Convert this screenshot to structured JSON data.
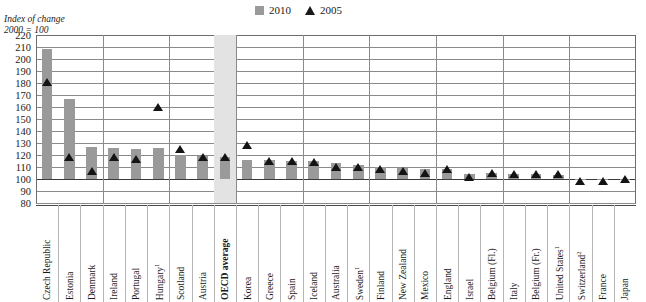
{
  "axis_title": {
    "line1": "Index of change",
    "line2": "2000 = 100"
  },
  "legend": {
    "items": [
      {
        "label": "2010",
        "marker": "square-marker",
        "color": "#9a9a9a"
      },
      {
        "label": "2005",
        "marker": "triangle-marker",
        "color": "#141414"
      }
    ]
  },
  "chart_data": {
    "type": "bar",
    "title": "Index of change",
    "subtitle": "2000 = 100",
    "xlabel": "",
    "ylabel": "Index of change (2000 = 100)",
    "ylim": [
      80,
      220
    ],
    "ytick_step": 10,
    "yticks": [
      220,
      210,
      200,
      190,
      180,
      170,
      160,
      150,
      140,
      130,
      120,
      110,
      100,
      90,
      80
    ],
    "grid": true,
    "legend_position": "top-center",
    "reference_line": 100,
    "highlight_category": "OECD average",
    "categories": [
      "Czech Republic",
      "Estonia",
      "Denmark",
      "Ireland",
      "Portugal",
      "Hungary¹",
      "Scotland",
      "Austria",
      "OECD average",
      "Korea",
      "Greece",
      "Spain",
      "Iceland",
      "Australia",
      "Sweden¹",
      "Finland",
      "New Zealand",
      "Mexico",
      "England",
      "Israel",
      "Belgium (Fl.)",
      "Italy",
      "Belgium (Fr.)",
      "United States¹",
      "Switzerland²",
      "France",
      "Japan"
    ],
    "series": [
      {
        "name": "2010",
        "type": "bar",
        "color": "#9a9a9a",
        "values": [
          208,
          167,
          127,
          126,
          125,
          126,
          120,
          119,
          118,
          116,
          116,
          115,
          115,
          113,
          112,
          110,
          109,
          108,
          108,
          104,
          105,
          104,
          104,
          103,
          100,
          99,
          100
        ]
      },
      {
        "name": "2005",
        "type": "scatter-triangle",
        "color": "#141414",
        "values": [
          181,
          118,
          107,
          118,
          117,
          160,
          125,
          118,
          118,
          128,
          115,
          115,
          114,
          110,
          110,
          108,
          107,
          105,
          108,
          102,
          105,
          104,
          104,
          104,
          98,
          98,
          100
        ]
      }
    ],
    "footnote_markers": [
      "1",
      "2"
    ]
  }
}
